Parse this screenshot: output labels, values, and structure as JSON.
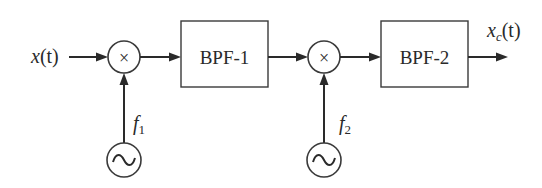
{
  "diagram": {
    "type": "block-diagram",
    "input": {
      "label_base": "x",
      "label_args": "(t)"
    },
    "output": {
      "label_base": "x",
      "label_sub": "c",
      "label_args": "(t)"
    },
    "mixers": [
      {
        "id": "mixer-1",
        "symbol": "×"
      },
      {
        "id": "mixer-2",
        "symbol": "×"
      }
    ],
    "filters": [
      {
        "id": "bpf-1",
        "label": "BPF-1"
      },
      {
        "id": "bpf-2",
        "label": "BPF-2"
      }
    ],
    "oscillators": [
      {
        "id": "osc-1",
        "symbol": "~",
        "freq_base": "f",
        "freq_sub": "1"
      },
      {
        "id": "osc-2",
        "symbol": "~",
        "freq_base": "f",
        "freq_sub": "2"
      }
    ],
    "connections": [
      [
        "input",
        "mixer-1"
      ],
      [
        "osc-1",
        "mixer-1"
      ],
      [
        "mixer-1",
        "bpf-1"
      ],
      [
        "bpf-1",
        "mixer-2"
      ],
      [
        "osc-2",
        "mixer-2"
      ],
      [
        "mixer-2",
        "bpf-2"
      ],
      [
        "bpf-2",
        "output"
      ]
    ],
    "colors": {
      "line": "#2a2a2a",
      "background": "#ffffff"
    }
  }
}
